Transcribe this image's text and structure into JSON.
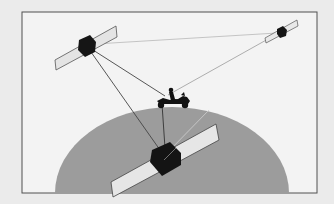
{
  "diagram": {
    "colors": {
      "background": "#ebebeb",
      "frame_fill": "#f3f3f3",
      "frame_stroke": "#505050",
      "earth": "#9c9c9c",
      "satellite_body": "#141414",
      "solar_panel": "#e4e4e4",
      "signal_line": "#4a4a4a",
      "signal_line_light": "#bdbdbd",
      "motorcycle": "#111111"
    },
    "nodes": [
      {
        "id": "satellite-top-left",
        "label": "Satellite",
        "x": 87,
        "y": 45
      },
      {
        "id": "satellite-top-right",
        "label": "Satellite",
        "x": 281,
        "y": 31
      },
      {
        "id": "satellite-bottom",
        "label": "Satellite",
        "x": 164,
        "y": 158
      },
      {
        "id": "motorcycle",
        "label": "Motorcyclist",
        "x": 174,
        "y": 98
      }
    ],
    "edges": [
      {
        "from": "satellite-top-left",
        "to": "satellite-top-right",
        "style": "light"
      },
      {
        "from": "satellite-top-left",
        "to": "motorcycle",
        "style": "dark"
      },
      {
        "from": "satellite-top-left",
        "to": "satellite-bottom",
        "style": "dark"
      },
      {
        "from": "satellite-top-right",
        "to": "motorcycle",
        "style": "light"
      },
      {
        "from": "motorcycle",
        "to": "satellite-bottom",
        "style": "dark"
      },
      {
        "from": "satellite-bottom",
        "to": "satellite-top-right",
        "style": "faint"
      }
    ],
    "earth": {
      "label": "Earth",
      "cx": 172,
      "cy": 192,
      "rx": 117,
      "ry": 85
    }
  }
}
